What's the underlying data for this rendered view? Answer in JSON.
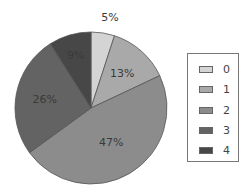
{
  "chart_data": {
    "type": "pie",
    "title": "",
    "categories": [
      "0",
      "1",
      "2",
      "3",
      "4"
    ],
    "values": [
      5,
      13,
      47,
      26,
      9
    ],
    "labels": [
      "5%",
      "13%",
      "47%",
      "26%",
      "9%"
    ],
    "colors": [
      "#d4d4d4",
      "#a9a9a9",
      "#8c8c8c",
      "#636363",
      "#474747"
    ],
    "legend_position": "right",
    "start_angle": "12 o'clock",
    "direction": "clockwise"
  },
  "legend": {
    "items": [
      {
        "label": "0",
        "color": "#d4d4d4"
      },
      {
        "label": "1",
        "color": "#a9a9a9"
      },
      {
        "label": "2",
        "color": "#8c8c8c"
      },
      {
        "label": "3",
        "color": "#636363"
      },
      {
        "label": "4",
        "color": "#474747"
      }
    ]
  }
}
